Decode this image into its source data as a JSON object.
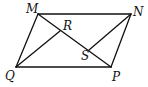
{
  "figure": {
    "type": "parallelogram",
    "stroke_color": "#111111",
    "background": "#ffffff",
    "points": {
      "M": {
        "label": "M",
        "x": 38,
        "y": 14,
        "lx": 26,
        "ly": 13
      },
      "N": {
        "label": "N",
        "x": 131,
        "y": 14,
        "lx": 133,
        "ly": 16
      },
      "P": {
        "label": "P",
        "x": 111,
        "y": 67,
        "lx": 112,
        "ly": 81
      },
      "Q": {
        "label": "Q",
        "x": 16,
        "y": 67,
        "lx": 5,
        "ly": 80
      },
      "R": {
        "label": "R",
        "x": 60,
        "y": 31,
        "lx": 63,
        "ly": 30
      },
      "S": {
        "label": "S",
        "x": 89,
        "y": 50,
        "lx": 81,
        "ly": 60
      }
    },
    "segments": [
      {
        "name": "side-mn",
        "from": "M",
        "to": "N"
      },
      {
        "name": "side-np",
        "from": "N",
        "to": "P"
      },
      {
        "name": "side-pq",
        "from": "P",
        "to": "Q"
      },
      {
        "name": "side-qm",
        "from": "Q",
        "to": "M"
      },
      {
        "name": "diagonal-mp",
        "from": "M",
        "to": "P"
      },
      {
        "name": "segment-qr",
        "from": "Q",
        "to": "R"
      },
      {
        "name": "segment-ns",
        "from": "N",
        "to": "S"
      }
    ]
  }
}
